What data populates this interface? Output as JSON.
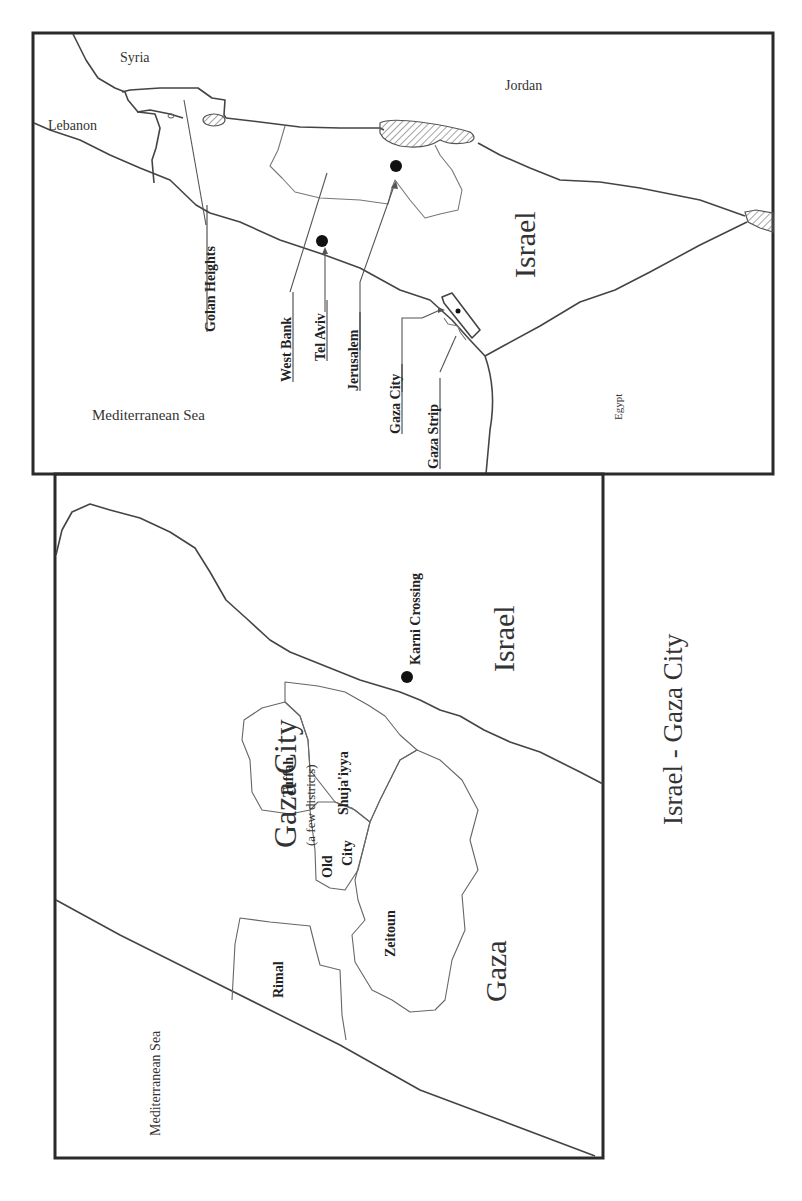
{
  "top_map": {
    "country_labels": {
      "syria": "Syria",
      "lebanon": "Lebanon",
      "jordan": "Jordan",
      "israel": "Israel",
      "egypt": "Egypt",
      "sea": "Mediterranean Sea"
    },
    "place_labels": {
      "golan_heights": "Golan Heights",
      "west_bank": "West Bank",
      "tel_aviv": "Tel Aviv",
      "jerusalem": "Jerusalem",
      "gaza_city": "Gaza City",
      "gaza_strip": "Gaza Strip"
    }
  },
  "bottom_map": {
    "title": "Gaza City",
    "subtitle": "(a few districts)",
    "israel": "Israel",
    "gaza": "Gaza",
    "sea": "Mediterranean Sea",
    "crossing": "Karni Crossing",
    "districts": {
      "tuffah": "Tuffah",
      "shujaiyya": "Shuja'iyya",
      "old": "Old",
      "city": "City",
      "zeitoun": "Zeitoun",
      "rimal": "Rimal"
    }
  },
  "caption": "Israel - Gaza City",
  "colors": {
    "frame": "#2a2a2a",
    "line": "#444444",
    "background": "#ffffff"
  }
}
